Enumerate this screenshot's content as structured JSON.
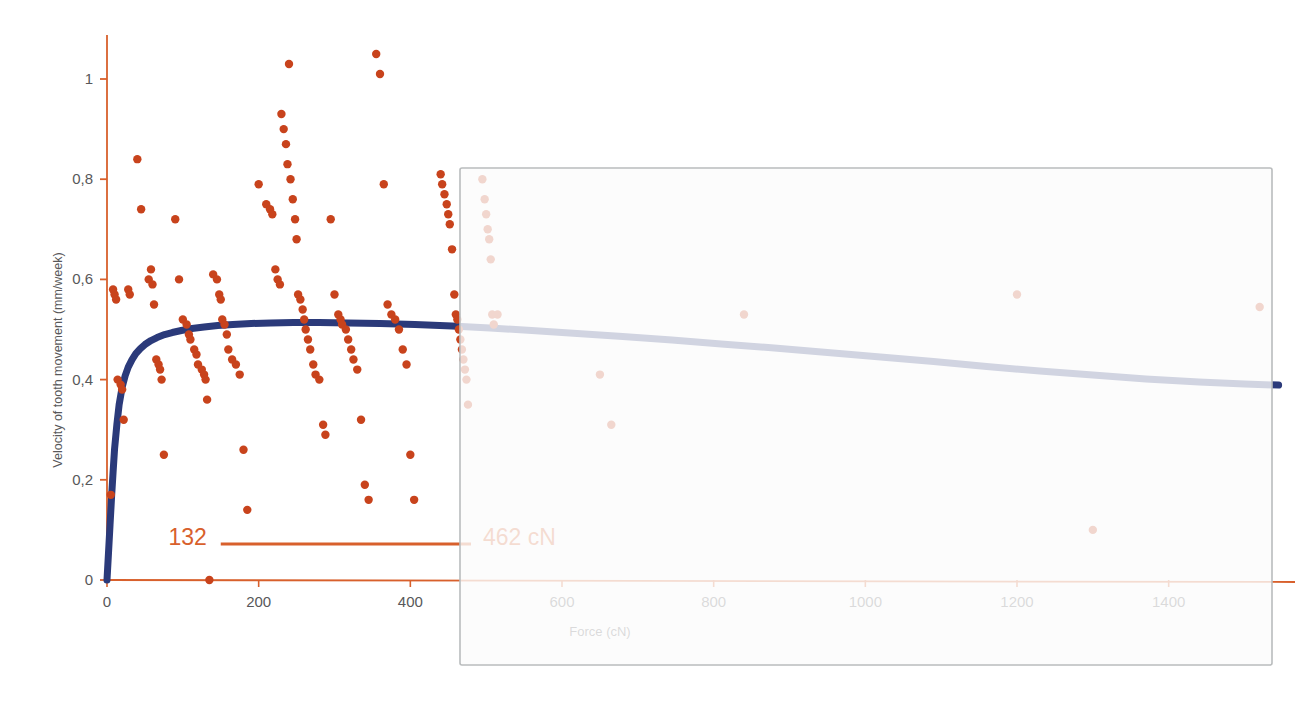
{
  "figure": {
    "background_color": "#ffffff",
    "accent_orange": "#d8602c",
    "accent_blue": "#2b3a7a",
    "point_color": "#c8431c",
    "axis_color": "#d8602c",
    "tick_label_color": "#58585a",
    "overlay_border_color": "#b9bcbd",
    "overlay_fill_color": "#fbfbfb"
  },
  "annotation": {
    "left_label": "132",
    "right_label": "462 cN",
    "bar_from_force": 150,
    "bar_to_force": 480
  },
  "overlay": {
    "name": "gray-panel",
    "x": 460,
    "y": 168,
    "width": 812,
    "height": 497
  },
  "chart_data": {
    "type": "scatter",
    "title": "",
    "subtitle": "",
    "xlabel": "Force (cN)",
    "ylabel": "Velocity of tooth movement (mm/week)",
    "xlim": [
      0,
      1560
    ],
    "ylim": [
      0,
      1.09
    ],
    "xticks": [
      0,
      200,
      400,
      600,
      800,
      1000,
      1200,
      1400
    ],
    "xticklabels": [
      "0",
      "200",
      "400",
      "600",
      "800",
      "1000",
      "1200",
      "1400"
    ],
    "yticks": [
      0,
      0.2,
      0.4,
      0.6,
      0.8,
      1
    ],
    "yticklabels": [
      "0",
      "0,2",
      "0,4",
      "0,6",
      "0,8",
      "1"
    ],
    "grid": false,
    "legend": null,
    "series": [
      {
        "name": "Measured tooth movement",
        "type": "scatter",
        "color": "#c8431c",
        "marker": "circle",
        "points": [
          [
            5,
            0.17
          ],
          [
            8,
            0.58
          ],
          [
            10,
            0.57
          ],
          [
            12,
            0.56
          ],
          [
            14,
            0.4
          ],
          [
            18,
            0.39
          ],
          [
            20,
            0.38
          ],
          [
            22,
            0.32
          ],
          [
            28,
            0.58
          ],
          [
            30,
            0.57
          ],
          [
            40,
            0.84
          ],
          [
            45,
            0.74
          ],
          [
            55,
            0.6
          ],
          [
            58,
            0.62
          ],
          [
            60,
            0.59
          ],
          [
            62,
            0.55
          ],
          [
            65,
            0.44
          ],
          [
            68,
            0.43
          ],
          [
            70,
            0.42
          ],
          [
            72,
            0.4
          ],
          [
            75,
            0.25
          ],
          [
            90,
            0.72
          ],
          [
            95,
            0.6
          ],
          [
            100,
            0.52
          ],
          [
            105,
            0.51
          ],
          [
            108,
            0.49
          ],
          [
            110,
            0.48
          ],
          [
            115,
            0.46
          ],
          [
            118,
            0.45
          ],
          [
            120,
            0.43
          ],
          [
            125,
            0.42
          ],
          [
            128,
            0.41
          ],
          [
            130,
            0.4
          ],
          [
            132,
            0.36
          ],
          [
            135,
            0.0
          ],
          [
            140,
            0.61
          ],
          [
            145,
            0.6
          ],
          [
            148,
            0.57
          ],
          [
            150,
            0.56
          ],
          [
            152,
            0.52
          ],
          [
            155,
            0.51
          ],
          [
            158,
            0.49
          ],
          [
            160,
            0.46
          ],
          [
            165,
            0.44
          ],
          [
            170,
            0.43
          ],
          [
            175,
            0.41
          ],
          [
            180,
            0.26
          ],
          [
            185,
            0.14
          ],
          [
            200,
            0.79
          ],
          [
            210,
            0.75
          ],
          [
            215,
            0.74
          ],
          [
            218,
            0.73
          ],
          [
            222,
            0.62
          ],
          [
            225,
            0.6
          ],
          [
            228,
            0.59
          ],
          [
            230,
            0.93
          ],
          [
            233,
            0.9
          ],
          [
            236,
            0.87
          ],
          [
            238,
            0.83
          ],
          [
            240,
            1.03
          ],
          [
            242,
            0.8
          ],
          [
            245,
            0.76
          ],
          [
            248,
            0.72
          ],
          [
            250,
            0.68
          ],
          [
            252,
            0.57
          ],
          [
            255,
            0.56
          ],
          [
            258,
            0.54
          ],
          [
            260,
            0.52
          ],
          [
            262,
            0.5
          ],
          [
            265,
            0.48
          ],
          [
            268,
            0.46
          ],
          [
            272,
            0.43
          ],
          [
            275,
            0.41
          ],
          [
            280,
            0.4
          ],
          [
            285,
            0.31
          ],
          [
            288,
            0.29
          ],
          [
            295,
            0.72
          ],
          [
            300,
            0.57
          ],
          [
            305,
            0.53
          ],
          [
            308,
            0.52
          ],
          [
            310,
            0.51
          ],
          [
            315,
            0.5
          ],
          [
            318,
            0.48
          ],
          [
            322,
            0.46
          ],
          [
            325,
            0.44
          ],
          [
            330,
            0.42
          ],
          [
            335,
            0.32
          ],
          [
            340,
            0.19
          ],
          [
            345,
            0.16
          ],
          [
            355,
            1.05
          ],
          [
            360,
            1.01
          ],
          [
            365,
            0.79
          ],
          [
            370,
            0.55
          ],
          [
            375,
            0.53
          ],
          [
            380,
            0.52
          ],
          [
            385,
            0.5
          ],
          [
            390,
            0.46
          ],
          [
            395,
            0.43
          ],
          [
            400,
            0.25
          ],
          [
            405,
            0.16
          ],
          [
            440,
            0.81
          ],
          [
            442,
            0.79
          ],
          [
            445,
            0.77
          ],
          [
            448,
            0.75
          ],
          [
            450,
            0.73
          ],
          [
            452,
            0.71
          ],
          [
            455,
            0.66
          ],
          [
            458,
            0.57
          ],
          [
            460,
            0.53
          ],
          [
            462,
            0.52
          ],
          [
            464,
            0.5
          ],
          [
            466,
            0.48
          ],
          [
            468,
            0.46
          ],
          [
            470,
            0.44
          ],
          [
            472,
            0.42
          ],
          [
            474,
            0.4
          ],
          [
            476,
            0.35
          ],
          [
            495,
            0.8
          ],
          [
            498,
            0.76
          ],
          [
            500,
            0.73
          ],
          [
            502,
            0.7
          ],
          [
            504,
            0.68
          ],
          [
            506,
            0.64
          ],
          [
            508,
            0.53
          ],
          [
            510,
            0.51
          ],
          [
            515,
            0.53
          ],
          [
            650,
            0.41
          ],
          [
            665,
            0.31
          ],
          [
            840,
            0.53
          ],
          [
            1200,
            0.57
          ],
          [
            1300,
            0.1
          ],
          [
            1520,
            0.545
          ]
        ]
      },
      {
        "name": "Fitted response curve",
        "type": "line",
        "color": "#2b3a7a",
        "linewidth": 7,
        "points": [
          [
            0,
            0.0
          ],
          [
            2,
            0.055
          ],
          [
            4,
            0.11
          ],
          [
            6,
            0.165
          ],
          [
            8,
            0.215
          ],
          [
            10,
            0.262
          ],
          [
            13,
            0.31
          ],
          [
            16,
            0.35
          ],
          [
            20,
            0.385
          ],
          [
            24,
            0.408
          ],
          [
            28,
            0.425
          ],
          [
            33,
            0.44
          ],
          [
            38,
            0.452
          ],
          [
            44,
            0.462
          ],
          [
            50,
            0.47
          ],
          [
            58,
            0.478
          ],
          [
            66,
            0.484
          ],
          [
            76,
            0.49
          ],
          [
            86,
            0.494
          ],
          [
            98,
            0.498
          ],
          [
            112,
            0.502
          ],
          [
            128,
            0.505
          ],
          [
            146,
            0.508
          ],
          [
            166,
            0.51
          ],
          [
            190,
            0.512
          ],
          [
            216,
            0.513
          ],
          [
            246,
            0.514
          ],
          [
            280,
            0.514
          ],
          [
            318,
            0.513
          ],
          [
            360,
            0.512
          ],
          [
            406,
            0.51
          ],
          [
            455,
            0.507
          ],
          [
            505,
            0.503
          ],
          [
            560,
            0.498
          ],
          [
            620,
            0.492
          ],
          [
            680,
            0.486
          ],
          [
            745,
            0.479
          ],
          [
            810,
            0.471
          ],
          [
            880,
            0.463
          ],
          [
            950,
            0.454
          ],
          [
            1020,
            0.445
          ],
          [
            1090,
            0.436
          ],
          [
            1160,
            0.426
          ],
          [
            1230,
            0.417
          ],
          [
            1300,
            0.409
          ],
          [
            1370,
            0.401
          ],
          [
            1440,
            0.395
          ],
          [
            1500,
            0.391
          ],
          [
            1545,
            0.389
          ]
        ]
      }
    ]
  }
}
